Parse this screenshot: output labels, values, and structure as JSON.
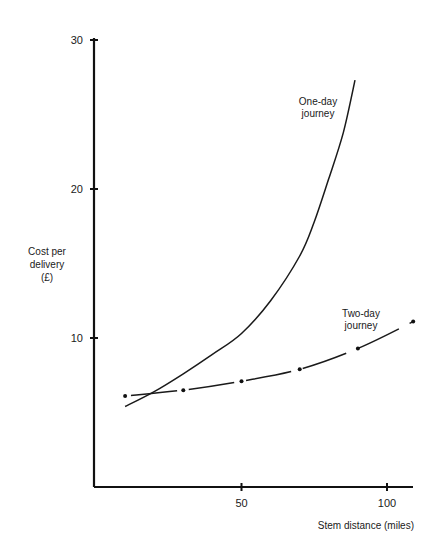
{
  "chart_data": {
    "type": "line",
    "title": "",
    "xlabel": "Stem distance (miles)",
    "ylabel_lines": [
      "Cost per",
      "delivery",
      "(£)"
    ],
    "xlim": [
      0,
      110
    ],
    "ylim": [
      0,
      30
    ],
    "x_ticks": [
      50,
      100
    ],
    "x_tick_labels": [
      "50",
      "100"
    ],
    "y_ticks": [
      10,
      20,
      30
    ],
    "y_tick_labels": [
      "10",
      "20",
      "30"
    ],
    "grid": false,
    "legend": "none",
    "series": [
      {
        "name": "One-day journey",
        "style": "solid",
        "label_lines": [
          "One-day",
          "journey"
        ],
        "x": [
          10,
          20,
          30,
          40,
          50,
          60,
          70,
          75,
          80,
          85,
          89
        ],
        "y": [
          5.4,
          6.4,
          7.6,
          8.9,
          10.3,
          12.5,
          15.5,
          17.8,
          20.7,
          23.8,
          27.3
        ]
      },
      {
        "name": "Two-day journey",
        "style": "dash-dot",
        "label_lines": [
          "Two-day",
          "journey"
        ],
        "x": [
          10,
          30,
          50,
          70,
          90,
          109
        ],
        "y": [
          6.1,
          6.5,
          7.1,
          7.9,
          9.3,
          11.1
        ],
        "markers": true
      }
    ]
  }
}
